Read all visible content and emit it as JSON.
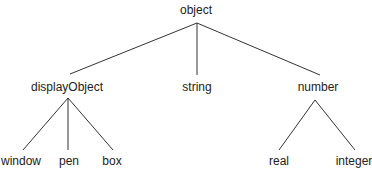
{
  "diagram": {
    "type": "tree",
    "root": {
      "label": "object",
      "children": [
        {
          "label": "displayObject",
          "children": [
            {
              "label": "window"
            },
            {
              "label": "pen"
            },
            {
              "label": "box"
            }
          ]
        },
        {
          "label": "string"
        },
        {
          "label": "number",
          "children": [
            {
              "label": "real"
            },
            {
              "label": "integer"
            }
          ]
        }
      ]
    },
    "nodes": {
      "object": "object",
      "displayObject": "displayObject",
      "string": "string",
      "number": "number",
      "window": "window",
      "pen": "pen",
      "box": "box",
      "real": "real",
      "integer": "integer"
    },
    "line_color": "#333333"
  }
}
